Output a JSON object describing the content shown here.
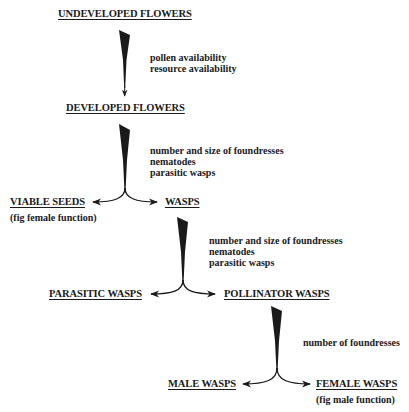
{
  "diagram": {
    "type": "flowchart",
    "nodes": {
      "undeveloped_flowers": "UNDEVELOPED FLOWERS",
      "developed_flowers": "DEVELOPED FLOWERS",
      "viable_seeds": "VIABLE SEEDS",
      "viable_seeds_note": "(fig female function)",
      "wasps": "WASPS",
      "parasitic_wasps": "PARASITIC WASPS",
      "pollinator_wasps": "POLLINATOR WASPS",
      "male_wasps": "MALE WASPS",
      "female_wasps": "FEMALE WASPS",
      "female_wasps_note": "(fig male function)"
    },
    "transitions": [
      {
        "from": "UNDEVELOPED FLOWERS",
        "to": [
          "DEVELOPED FLOWERS"
        ],
        "factors": [
          "pollen availability",
          "resource availability"
        ]
      },
      {
        "from": "DEVELOPED FLOWERS",
        "to": [
          "VIABLE SEEDS",
          "WASPS"
        ],
        "factors": [
          "number and size of foundresses",
          "nematodes",
          "parasitic wasps"
        ]
      },
      {
        "from": "WASPS",
        "to": [
          "PARASITIC WASPS",
          "POLLINATOR WASPS"
        ],
        "factors": [
          "number and size of foundresses",
          "nematodes",
          "parasitic wasps"
        ]
      },
      {
        "from": "POLLINATOR WASPS",
        "to": [
          "MALE WASPS",
          "FEMALE WASPS"
        ],
        "factors": [
          "number of foundresses"
        ]
      }
    ]
  }
}
